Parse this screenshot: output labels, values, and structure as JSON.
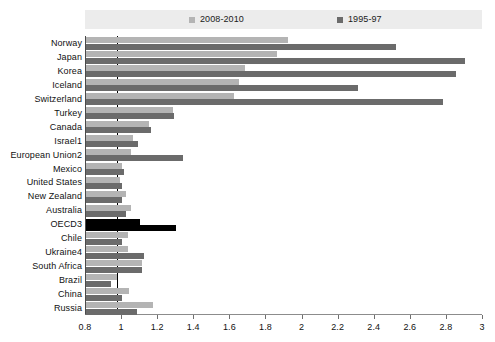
{
  "legend": {
    "position": "top",
    "entries": [
      {
        "label": "2008-2010",
        "color": "#b4b4b4",
        "icon": "square-swatch-icon"
      },
      {
        "label": "1995-97",
        "color": "#6b6b6b",
        "icon": "square-swatch-icon"
      }
    ]
  },
  "chart_data": {
    "type": "bar",
    "orientation": "horizontal",
    "title": "",
    "subtitle": "",
    "xlabel": "",
    "ylabel": "",
    "xlim": [
      0.8,
      3
    ],
    "xticks": [
      0.8,
      1,
      1.2,
      1.4,
      1.6,
      1.8,
      2,
      2.2,
      2.4,
      2.6,
      2.8,
      3
    ],
    "xtick_labels": [
      "0.8",
      "1",
      "1.2",
      "1.4",
      "1.6",
      "1.8",
      "2",
      "2.2",
      "2.4",
      "2.6",
      "2.8",
      "3"
    ],
    "grid": false,
    "reference_line": 0.97,
    "legend_position": "top",
    "categories": [
      "Norway",
      "Japan",
      "Korea",
      "Iceland",
      "Switzerland",
      "Turkey",
      "Canada",
      "Israel1",
      "European Union2",
      "Mexico",
      "United States",
      "New Zealand",
      "Australia",
      "OECD3",
      "Chile",
      "Ukraine4",
      "South Africa",
      "Brazil",
      "China",
      "Russia"
    ],
    "series": [
      {
        "name": "2008-2010",
        "color": "#b4b4b4",
        "values": [
          1.92,
          1.86,
          1.68,
          1.65,
          1.62,
          1.28,
          1.15,
          1.06,
          1.05,
          1.0,
          0.99,
          1.02,
          1.05,
          1.1,
          1.03,
          1.03,
          1.11,
          0.97,
          1.04,
          1.17
        ]
      },
      {
        "name": "1995-97",
        "color": "#6b6b6b",
        "values": [
          2.52,
          2.9,
          2.85,
          2.31,
          2.78,
          1.29,
          1.16,
          1.09,
          1.34,
          1.01,
          1.0,
          1.0,
          1.02,
          1.3,
          1.0,
          1.12,
          1.11,
          0.94,
          1.0,
          1.08
        ]
      }
    ],
    "highlight": {
      "category": "OECD3",
      "color": "#000000",
      "note": "OECD3 bars drawn in black"
    }
  }
}
